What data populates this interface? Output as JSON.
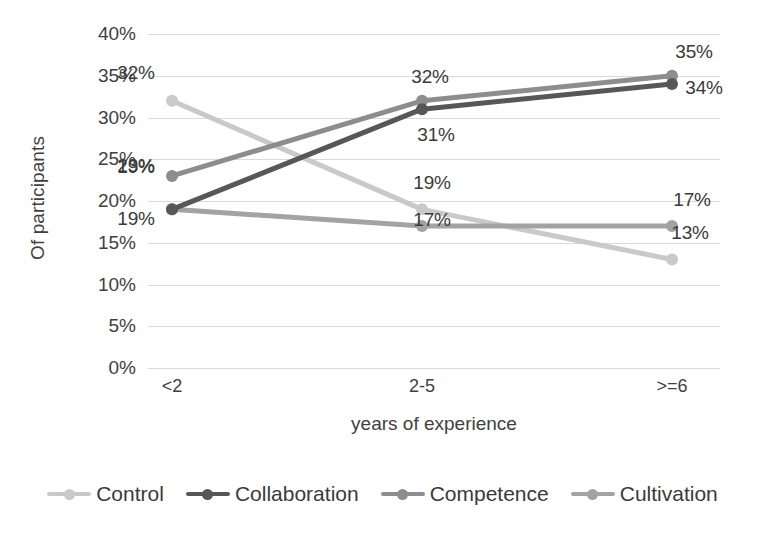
{
  "chart_data": {
    "type": "line",
    "title": "",
    "xlabel": "years of experience",
    "ylabel": "Of participants",
    "categories": [
      "<2",
      "2-5",
      ">=6"
    ],
    "ylim": [
      0,
      40
    ],
    "ytick_labels": [
      "0%",
      "5%",
      "10%",
      "15%",
      "20%",
      "25%",
      "30%",
      "35%",
      "40%"
    ],
    "ytick_values": [
      0,
      5,
      10,
      15,
      20,
      25,
      30,
      35,
      40
    ],
    "grid": true,
    "legend_position": "bottom",
    "series": [
      {
        "name": "Control",
        "color": "#c9c9c9",
        "values": [
          32,
          19,
          13
        ],
        "labels": [
          "32%",
          "19%",
          "13%"
        ]
      },
      {
        "name": "Collaboration",
        "color": "#575757",
        "values": [
          19,
          31,
          34
        ],
        "labels": [
          "19%",
          "31%",
          "34%"
        ]
      },
      {
        "name": "Competence",
        "color": "#8d8d8d",
        "values": [
          23,
          32,
          35
        ],
        "labels": [
          "23%",
          "32%",
          "35%"
        ]
      },
      {
        "name": "Cultivation",
        "color": "#a3a3a3",
        "values": [
          19,
          17,
          17
        ],
        "labels": [
          "19%",
          "17%",
          "17%"
        ]
      }
    ]
  },
  "axes": {
    "y_title": "Of participants",
    "x_title": "years of experience"
  }
}
